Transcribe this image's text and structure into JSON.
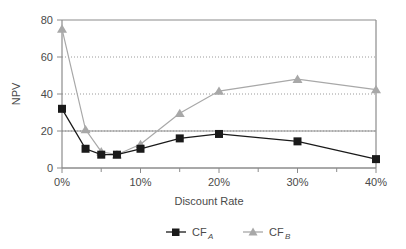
{
  "chart_data": {
    "type": "line",
    "title": "",
    "xlabel": "Discount Rate",
    "ylabel": "NPV",
    "x": [
      0,
      3,
      5,
      7,
      10,
      15,
      20,
      30,
      40
    ],
    "xtick_labels": [
      "0%",
      "10%",
      "20%",
      "30%",
      "40%"
    ],
    "xtick_values": [
      0,
      10,
      20,
      30,
      40
    ],
    "xminor_tick_values": [
      5,
      15,
      25,
      35
    ],
    "xlim": [
      0,
      40
    ],
    "ytick_labels": [
      "-20",
      "0",
      "20",
      "40",
      "60",
      "80"
    ],
    "ytick_values": [
      -20,
      0,
      20,
      40,
      60,
      80
    ],
    "ylim": [
      -20,
      80
    ],
    "grid": "horizontal-dotted",
    "legend_position": "below",
    "series": [
      {
        "name": "CF_A",
        "label_base": "CF",
        "label_sub": "A",
        "marker": "square",
        "color": "#1a1a1a",
        "values": [
          20,
          -7,
          -11,
          -11,
          -7,
          0,
          3,
          -2,
          -14
        ]
      },
      {
        "name": "CF_B",
        "label_base": "CF",
        "label_sub": "B",
        "marker": "triangle",
        "color": "#a8a8a8",
        "values": [
          74,
          6,
          -9,
          -11,
          -4,
          17,
          32,
          40,
          33
        ]
      }
    ]
  },
  "axes": {
    "y_labels": [
      "80",
      "60",
      "40",
      "20",
      "0",
      "-20"
    ],
    "x_labels": [
      "0%",
      "10%",
      "20%",
      "30%",
      "40%"
    ],
    "x_title": "Discount Rate",
    "y_title": "NPV"
  },
  "legend": {
    "entries": [
      {
        "base": "CF",
        "sub": "A",
        "marker": "square-marker",
        "color": "#1a1a1a"
      },
      {
        "base": "CF",
        "sub": "B",
        "marker": "triangle-marker",
        "color": "#a8a8a8"
      }
    ]
  },
  "colors": {
    "series_a": "#1a1a1a",
    "series_b": "#a8a8a8",
    "axis": "#8c8c8c",
    "grid": "#9a9a9a",
    "text": "#4a4a4a",
    "background": "#ffffff"
  }
}
